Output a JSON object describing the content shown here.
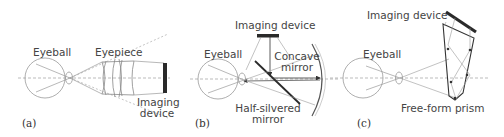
{
  "figure": {
    "panels": [
      {
        "id": "a",
        "caption": "(a)",
        "labels": {
          "eyeball": "Eyeball",
          "component": "Eyepiece",
          "imaging_device_line1": "Imaging",
          "imaging_device_line2": "device"
        }
      },
      {
        "id": "b",
        "caption": "(b)",
        "labels": {
          "imaging_device": "Imaging device",
          "eyeball": "Eyeball",
          "concave_line1": "Concave",
          "concave_line2": "mirror",
          "half_line1": "Half-silvered",
          "half_line2": "mirror"
        }
      },
      {
        "id": "c",
        "caption": "(c)",
        "labels": {
          "imaging_device": "Imaging device",
          "eyeball": "Eyeball",
          "prism": "Free-form prism"
        }
      }
    ],
    "colors": {
      "line": "#9a9a9a",
      "dashed": "#aaaaaa",
      "dark": "#2a2a2a",
      "text": "#444444"
    }
  }
}
